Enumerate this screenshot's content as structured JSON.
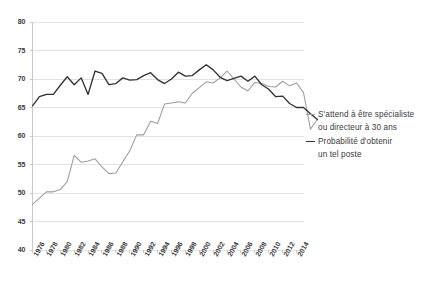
{
  "chart_data": {
    "type": "line",
    "title": "",
    "xlabel": "",
    "ylabel": "",
    "ylim": [
      40,
      80
    ],
    "ytick_values": [
      40,
      45,
      50,
      55,
      60,
      65,
      70,
      75,
      80
    ],
    "ytick_labels": [
      "40",
      "45",
      "50",
      "55",
      "60",
      "65",
      "70",
      "75",
      "80"
    ],
    "grid": true,
    "grid_axis": "y",
    "legend_position": "right",
    "x": [
      1976,
      1977,
      1978,
      1979,
      1980,
      1981,
      1982,
      1983,
      1984,
      1985,
      1986,
      1987,
      1988,
      1989,
      1990,
      1991,
      1992,
      1993,
      1994,
      1995,
      1996,
      1997,
      1998,
      1999,
      2000,
      2001,
      2002,
      2003,
      2004,
      2005,
      2006,
      2007,
      2008,
      2009,
      2010,
      2011,
      2012,
      2013,
      2014,
      2015
    ],
    "xtick_labels": [
      "1976",
      "1978",
      "1980",
      "1982",
      "1984",
      "1986",
      "1988",
      "1990",
      "1992",
      "1994",
      "1996",
      "1998",
      "2000",
      "2002",
      "2004",
      "2006",
      "2008",
      "2010",
      "2012",
      "2014"
    ],
    "xtick_values": [
      1976,
      1978,
      1980,
      1982,
      1984,
      1986,
      1988,
      1990,
      1992,
      1994,
      1996,
      1998,
      2000,
      2002,
      2004,
      2006,
      2008,
      2010,
      2012,
      2014
    ],
    "series": [
      {
        "name": "S'attend à être spécialiste ou directeur à 30 ans",
        "color": "#9d9d9d",
        "values": [
          48.0,
          49.1,
          50.2,
          50.2,
          50.6,
          52.0,
          56.6,
          55.4,
          55.6,
          56.0,
          54.6,
          53.4,
          53.5,
          55.5,
          57.4,
          60.2,
          60.2,
          62.6,
          62.2,
          65.6,
          65.8,
          66.0,
          65.8,
          67.5,
          68.5,
          69.5,
          69.3,
          70.2,
          71.4,
          70.0,
          68.6,
          67.9,
          69.4,
          69.2,
          68.7,
          68.6,
          69.6,
          68.8,
          69.3,
          67.6
        ]
      },
      {
        "name": "Probabilité d'obtenir un tel poste",
        "color": "#333333",
        "values": [
          65.3,
          66.9,
          67.3,
          67.3,
          68.9,
          70.4,
          69.0,
          70.2,
          67.3,
          71.4,
          71.0,
          69.0,
          69.2,
          70.2,
          69.8,
          69.9,
          70.6,
          71.1,
          69.9,
          69.2,
          70.0,
          71.2,
          70.5,
          70.6,
          71.6,
          72.5,
          71.6,
          70.3,
          69.7,
          70.1,
          70.5,
          69.6,
          70.5,
          69.0,
          68.2,
          66.9,
          67.0,
          65.7,
          65.0,
          65.0
        ]
      }
    ],
    "series_tail": [
      {
        "name": "S'attend à être spécialiste ou directeur à 30 ans",
        "values": [
          61.2,
          62.9
        ]
      },
      {
        "name": "Probabilité d'obtenir un tel poste",
        "values": [
          63.9,
          62.9
        ]
      }
    ]
  },
  "legend": {
    "entries": [
      {
        "line1": "S'attend à être spécialiste",
        "line2": "ou directeur à 30 ans",
        "color": "#9d9d9d",
        "weight": "thin"
      },
      {
        "line1": "Probabilité d'obtenir",
        "line2": "un tel poste",
        "color": "#333333",
        "weight": "thick"
      }
    ]
  },
  "colors": {
    "background": "#ffffff",
    "gridline": "#e3e3e3",
    "axis": "#c9c9c9",
    "tick_text": "#3b3b3b",
    "series_light": "#9d9d9d",
    "series_dark": "#333333"
  }
}
